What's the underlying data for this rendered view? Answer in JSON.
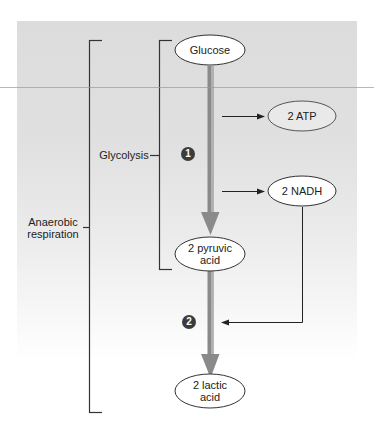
{
  "diagram": {
    "type": "metabolic-pathway",
    "colors": {
      "panel": "#dcdcdc",
      "main_arrow": "#8a8a8a",
      "main_arrow_highlight": "#b5b5b5",
      "lines": "#222222",
      "node_fill": "#ffffff",
      "step_badge": "#3c3c3c"
    },
    "brackets": {
      "outer": {
        "label_line1": "Anaerobic",
        "label_line2": "respiration"
      },
      "inner": {
        "label": "Glycolysis"
      }
    },
    "nodes": {
      "glucose": "Glucose",
      "atp": "2 ATP",
      "nadh": "2 NADH",
      "pyruvic": "2 pyruvic\nacid",
      "lactic": "2 lactic\nacid"
    },
    "steps": {
      "one": "1",
      "two": "2"
    },
    "edges": [
      {
        "from": "Glucose",
        "to": "2 pyruvic acid",
        "step": "1"
      },
      {
        "from": "step 1",
        "to": "2 ATP"
      },
      {
        "from": "step 1",
        "to": "2 NADH"
      },
      {
        "from": "2 NADH",
        "to": "step 2"
      },
      {
        "from": "2 pyruvic acid",
        "to": "2 lactic acid",
        "step": "2"
      }
    ]
  }
}
